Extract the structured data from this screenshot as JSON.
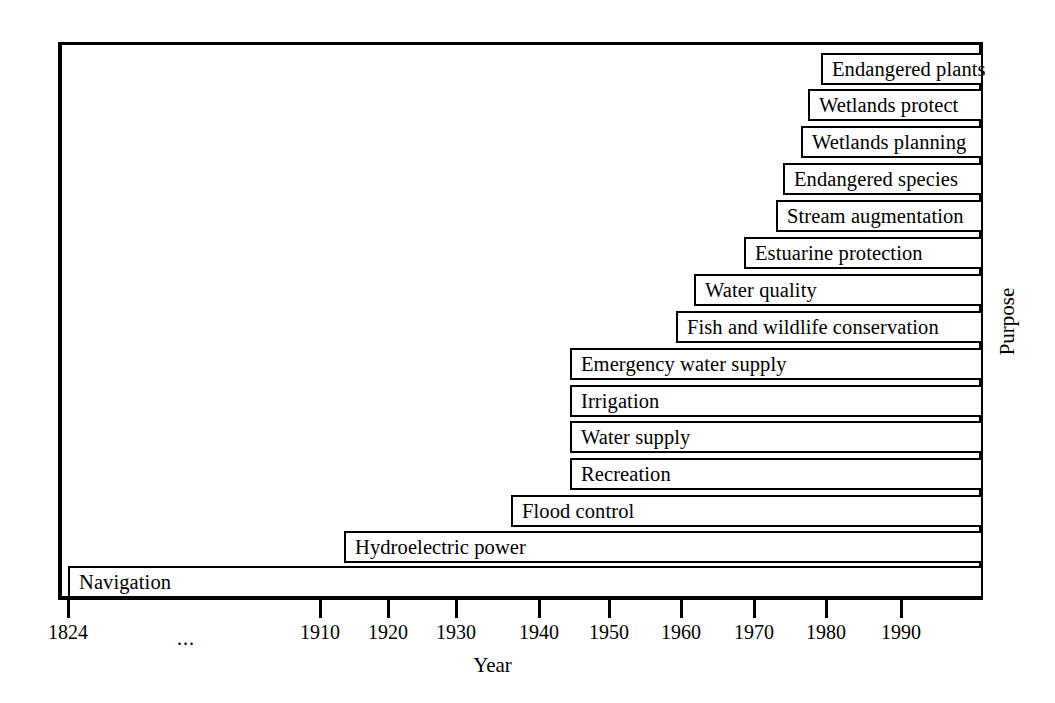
{
  "chart_data": {
    "type": "bar",
    "orientation": "horizontal",
    "title": "",
    "xlabel": "Year",
    "ylabel": "Purpose",
    "xlim": [
      1824,
      1998
    ],
    "grid": false,
    "legend": null,
    "note": "Broken x-axis between 1824 and 1910, indicated by an ellipsis. Each bar spans from its start year to the present (right edge of plot).",
    "x_ticks": [
      {
        "label": "1824",
        "value": 1824,
        "x_px": 68
      },
      {
        "label": "...",
        "value": null,
        "x_px": 186
      },
      {
        "label": "1910",
        "value": 1910,
        "x_px": 320
      },
      {
        "label": "1920",
        "value": 1920,
        "x_px": 388
      },
      {
        "label": "1930",
        "value": 1930,
        "x_px": 456
      },
      {
        "label": "1940",
        "value": 1940,
        "x_px": 539
      },
      {
        "label": "1950",
        "value": 1950,
        "x_px": 609
      },
      {
        "label": "1960",
        "value": 1960,
        "x_px": 681
      },
      {
        "label": "1970",
        "value": 1970,
        "x_px": 754
      },
      {
        "label": "1980",
        "value": 1980,
        "x_px": 826
      },
      {
        "label": "1990",
        "value": 1990,
        "x_px": 901
      }
    ],
    "categories": [
      "Endangered plants",
      "Wetlands protect",
      "Wetlands planning",
      "Endangered species",
      "Stream augmentation",
      "Estuarine protection",
      "Water quality",
      "Fish and wildlife conservation",
      "Emergency water supply",
      "Irrigation",
      "Water supply",
      "Recreation",
      "Flood control",
      "Hydroelectric power",
      "Navigation"
    ],
    "start_years": [
      1980,
      1979,
      1977,
      1975,
      1974,
      1970,
      1963,
      1961,
      1945,
      1945,
      1945,
      1945,
      1936,
      1913,
      1824
    ],
    "end_year": 1998,
    "bars": [
      {
        "label": "Endangered plants",
        "start_year": 1980,
        "x_px": 821,
        "y_px": 53,
        "width_px": 162
      },
      {
        "label": "Wetlands protect",
        "start_year": 1979,
        "x_px": 808,
        "y_px": 89,
        "width_px": 175
      },
      {
        "label": "Wetlands planning",
        "start_year": 1977,
        "x_px": 801,
        "y_px": 126,
        "width_px": 182
      },
      {
        "label": "Endangered species",
        "start_year": 1975,
        "x_px": 783,
        "y_px": 163,
        "width_px": 200
      },
      {
        "label": "Stream augmentation",
        "start_year": 1974,
        "x_px": 776,
        "y_px": 200,
        "width_px": 207
      },
      {
        "label": "Estuarine protection",
        "start_year": 1970,
        "x_px": 744,
        "y_px": 237,
        "width_px": 239
      },
      {
        "label": "Water quality",
        "start_year": 1963,
        "x_px": 694,
        "y_px": 274,
        "width_px": 289
      },
      {
        "label": "Fish and wildlife conservation",
        "start_year": 1961,
        "x_px": 676,
        "y_px": 311,
        "width_px": 307
      },
      {
        "label": "Emergency water supply",
        "start_year": 1945,
        "x_px": 570,
        "y_px": 348,
        "width_px": 413
      },
      {
        "label": "Irrigation",
        "start_year": 1945,
        "x_px": 570,
        "y_px": 385,
        "width_px": 413
      },
      {
        "label": "Water supply",
        "start_year": 1945,
        "x_px": 570,
        "y_px": 421,
        "width_px": 413
      },
      {
        "label": "Recreation",
        "start_year": 1945,
        "x_px": 570,
        "y_px": 458,
        "width_px": 413
      },
      {
        "label": "Flood control",
        "start_year": 1936,
        "x_px": 511,
        "y_px": 495,
        "width_px": 472
      },
      {
        "label": "Hydroelectric power",
        "start_year": 1913,
        "x_px": 344,
        "y_px": 531,
        "width_px": 639
      },
      {
        "label": "Navigation",
        "start_year": 1824,
        "x_px": 68,
        "y_px": 566,
        "width_px": 915
      }
    ]
  },
  "axes": {
    "x_title": "Year",
    "y_title": "Purpose"
  },
  "colors": {
    "ink": "#000000",
    "paper": "#ffffff"
  }
}
